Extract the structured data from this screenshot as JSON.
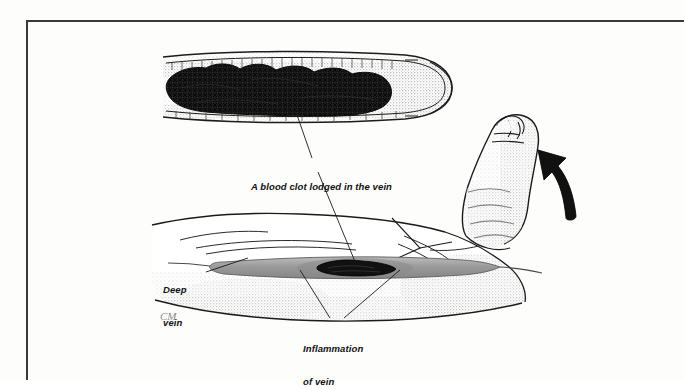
{
  "document": {
    "type": "medical-illustration",
    "subject": "Deep vein thrombosis of the lower leg with foot dorsiflexion",
    "background_color": "#ffffff",
    "border_color": "#3a3a3a"
  },
  "labels": {
    "blood_clot": "A blood clot lodged in the vein",
    "deep_vein_line1": "Deep",
    "deep_vein_line2": "vein",
    "inflammation_line1": "Inflammation",
    "inflammation_line2": "of vein"
  },
  "signature": {
    "text": "CM"
  },
  "figures": {
    "inset_label": "cutaway-vein-with-clot",
    "leg_label": "lower-leg-and-foot",
    "arrow_label": "foot-flexion-arrow",
    "vein_band_color": "#9a9a9a",
    "clot_color": "#141414"
  }
}
